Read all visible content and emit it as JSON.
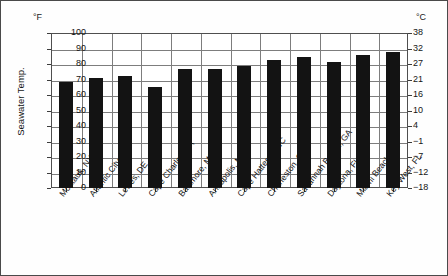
{
  "chart_data": {
    "type": "bar",
    "title": "",
    "xlabel": "",
    "ylabel": "Seawater Temp.",
    "unit_left": "°F",
    "unit_right": "°C",
    "ylim": [
      0,
      100
    ],
    "grid": true,
    "legend": false,
    "categories": [
      "Montauk, NY",
      "Atlantic City, NJ",
      "Lewes, DE",
      "Cape Charles, VA",
      "Baltimore, MD",
      "Annapolis, MD",
      "Cape Hatteras, NC",
      "Charleston, SC",
      "Savannah Beach, GA",
      "Daytona, FL",
      "Miami Beach, FL",
      "Key West, FL"
    ],
    "values": [
      68.5,
      71,
      72.5,
      65,
      77,
      76.5,
      78.5,
      82.5,
      84.5,
      81.5,
      85.5,
      87.5
    ],
    "yticks_left": [
      "100",
      "90",
      "80",
      "70",
      "60",
      "50",
      "40",
      "30",
      "20",
      "10",
      "0"
    ],
    "yticks_right": [
      "38",
      "32",
      "27",
      "21",
      "16",
      "10",
      "4",
      "−1",
      "−7",
      "−12",
      "−18"
    ]
  }
}
